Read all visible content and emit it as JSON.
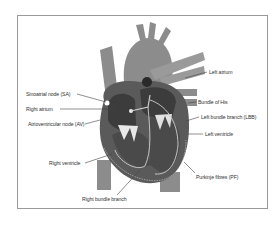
{
  "diagram": {
    "colors": {
      "frame_border": "#9a9a9a",
      "vessel": "#8c8c8c",
      "muscle": "#5a5a5a",
      "chamber": "#3c3c3c",
      "conduction": "#cfcfcf",
      "leader_line": "#444444"
    },
    "labels": {
      "sa_node": "Sinoatrial node (SA)",
      "right_atrium": "Right atrium",
      "av_node": "Atrioventricular node (AV)",
      "right_ventricle": "Right ventricle",
      "right_bundle_branch": "Right bundle branch",
      "left_atrium": "Left atrium",
      "bundle_of_his": "Bundle of His",
      "left_bundle_branch": "Left bundle branch (LBB)",
      "left_ventricle": "Left ventricle",
      "purkinje_fibres": "Purkinje fibres (PF)"
    }
  }
}
